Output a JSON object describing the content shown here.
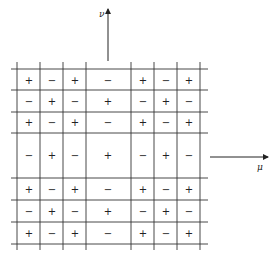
{
  "diagram": {
    "type": "sign-grid",
    "axes": {
      "vertical": {
        "label": "ν",
        "direction": "up"
      },
      "horizontal": {
        "label": "μ",
        "direction": "right"
      }
    },
    "grid": {
      "column_lines_x": [
        17,
        40,
        63,
        86,
        131,
        154,
        177,
        200
      ],
      "row_lines_y": [
        69,
        90,
        112,
        133,
        178,
        200,
        222,
        244
      ],
      "column_centers_x": [
        29,
        52,
        75,
        108,
        143,
        166,
        189
      ],
      "row_centers_y": [
        80,
        101,
        122,
        155,
        189,
        211,
        233
      ],
      "signs": [
        [
          "+",
          "−",
          "+",
          "−",
          "+",
          "−",
          "+"
        ],
        [
          "−",
          "+",
          "−",
          "+",
          "−",
          "+",
          "−"
        ],
        [
          "+",
          "−",
          "+",
          "−",
          "+",
          "−",
          "+"
        ],
        [
          "−",
          "+",
          "−",
          "+",
          "−",
          "+",
          "−"
        ],
        [
          "+",
          "−",
          "+",
          "−",
          "+",
          "−",
          "+"
        ],
        [
          "−",
          "+",
          "−",
          "+",
          "−",
          "+",
          "−"
        ],
        [
          "+",
          "−",
          "+",
          "−",
          "+",
          "−",
          "+"
        ]
      ]
    },
    "colors": {
      "line": "#333333",
      "background": "#ffffff"
    }
  }
}
